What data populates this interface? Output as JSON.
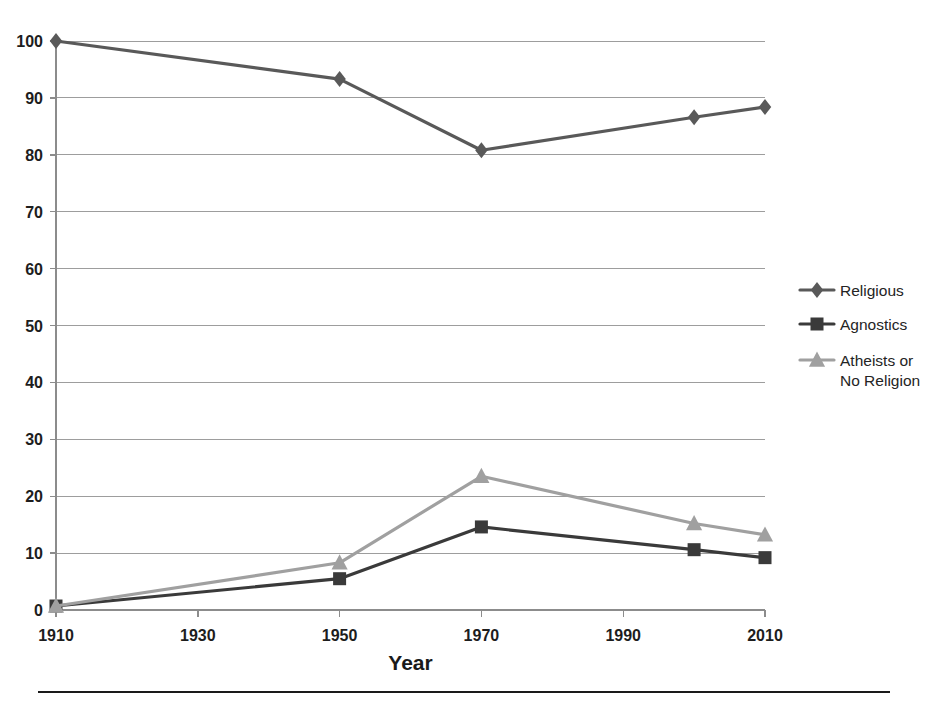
{
  "chart_data": {
    "type": "line",
    "title": "",
    "xlabel": "Year",
    "ylabel": "",
    "x": [
      1910,
      1950,
      1970,
      2000,
      2010
    ],
    "xticks": [
      1910,
      1930,
      1950,
      1970,
      1990,
      2010
    ],
    "yticks": [
      0,
      10,
      20,
      30,
      40,
      50,
      60,
      70,
      80,
      90,
      100
    ],
    "xlim": [
      1910,
      2010
    ],
    "ylim": [
      0,
      100
    ],
    "grid": true,
    "legend_position": "right",
    "series": [
      {
        "name": "Religious",
        "marker": "diamond",
        "color": "#595959",
        "x": [
          1910,
          1950,
          1970,
          2000,
          2010
        ],
        "values": [
          100.0,
          93.3,
          80.8,
          86.6,
          88.4
        ]
      },
      {
        "name": "Agnostics",
        "marker": "square",
        "color": "#3a3a3a",
        "x": [
          1910,
          1950,
          1970,
          2000,
          2010
        ],
        "values": [
          0.7,
          5.5,
          14.6,
          10.6,
          9.2
        ]
      },
      {
        "name": "Atheists or No Religion",
        "marker": "triangle",
        "color": "#a0a0a0",
        "x": [
          1910,
          1950,
          1970,
          2000,
          2010
        ],
        "values": [
          0.7,
          8.3,
          23.5,
          15.2,
          13.2
        ]
      }
    ]
  },
  "axis": {
    "x_title": "Year",
    "x_tick_labels": [
      "1910",
      "1930",
      "1950",
      "1970",
      "1990",
      "2010"
    ],
    "y_tick_labels": [
      "0",
      "10",
      "20",
      "30",
      "40",
      "50",
      "60",
      "70",
      "80",
      "90",
      "100"
    ]
  },
  "legend": {
    "entries": [
      {
        "label": "Religious",
        "line1": "Religious",
        "line2": "",
        "marker": "diamond",
        "color": "#595959"
      },
      {
        "label": "Agnostics",
        "line1": "Agnostics",
        "line2": "",
        "marker": "square",
        "color": "#3a3a3a"
      },
      {
        "label": "Atheists or No Religion",
        "line1": "Atheists or",
        "line2": "No Religion",
        "marker": "triangle",
        "color": "#a0a0a0"
      }
    ]
  },
  "colors": {
    "religious": "#595959",
    "agnostics": "#3a3a3a",
    "atheists": "#a0a0a0",
    "gridline": "#9d9d9d",
    "axis": "#8c8c8c",
    "text": "#1a1a1a",
    "background": "#ffffff"
  },
  "footer": {
    "rule": true
  }
}
